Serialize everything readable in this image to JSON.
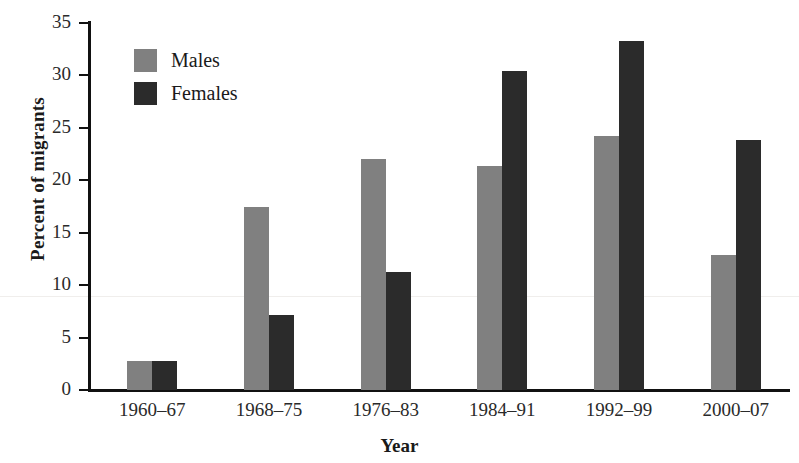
{
  "chart_data": {
    "type": "bar",
    "title": "",
    "xlabel": "Year",
    "ylabel": "Percent of migrants",
    "categories": [
      "1960–67",
      "1968–75",
      "1976–83",
      "1984–91",
      "1992–99",
      "2000–07"
    ],
    "series": [
      {
        "name": "Males",
        "color": "#808080",
        "values": [
          2.8,
          17.5,
          22.0,
          21.4,
          24.2,
          12.9
        ]
      },
      {
        "name": "Females",
        "color": "#2b2b2b",
        "values": [
          2.8,
          7.2,
          11.3,
          30.4,
          33.3,
          23.8
        ]
      }
    ],
    "ylim": [
      0,
      35
    ],
    "ytick_labels": [
      "0",
      "5",
      "10",
      "15",
      "20",
      "25",
      "30",
      "35"
    ],
    "ytick_values": [
      0,
      5,
      10,
      15,
      20,
      25,
      30,
      35
    ],
    "grid": false,
    "legend_position": "upper-left-inside"
  },
  "legend": {
    "items": [
      {
        "label": "Males",
        "color": "#808080"
      },
      {
        "label": "Females",
        "color": "#2b2b2b"
      }
    ]
  },
  "axes": {
    "x_title": "Year",
    "y_title": "Percent of migrants"
  }
}
